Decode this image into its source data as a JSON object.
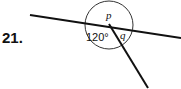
{
  "problem": {
    "number": "21.",
    "labels": {
      "p": "p",
      "q": "q",
      "angle": "120°"
    }
  }
}
